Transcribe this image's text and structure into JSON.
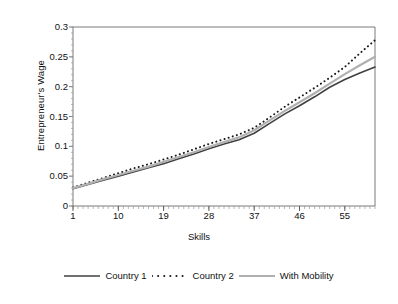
{
  "chart_data": {
    "type": "line",
    "title": "",
    "xlabel": "Skills",
    "ylabel": "Entrepreneur's Wage",
    "xlim": [
      1,
      61
    ],
    "ylim": [
      0,
      0.3
    ],
    "grid": false,
    "legend_position": "bottom",
    "xticks": [
      "1",
      "10",
      "19",
      "28",
      "37",
      "46",
      "55"
    ],
    "xtick_values": [
      1,
      10,
      19,
      28,
      37,
      46,
      55
    ],
    "yticks": [
      "0",
      "0.05",
      "0.1",
      "0.15",
      "0.2",
      "0.25",
      "0.3"
    ],
    "ytick_values": [
      0,
      0.05,
      0.1,
      0.15,
      0.2,
      0.25,
      0.3
    ],
    "x": [
      1,
      4,
      7,
      10,
      13,
      16,
      19,
      22,
      25,
      28,
      31,
      34,
      37,
      40,
      43,
      46,
      49,
      52,
      55,
      58,
      61
    ],
    "series": [
      {
        "name": "Country 1",
        "style": "solid",
        "color": "#404040",
        "width": 1.6,
        "values": [
          0.029,
          0.036,
          0.043,
          0.05,
          0.057,
          0.064,
          0.071,
          0.079,
          0.087,
          0.096,
          0.104,
          0.111,
          0.122,
          0.138,
          0.154,
          0.168,
          0.183,
          0.199,
          0.212,
          0.223,
          0.233
        ]
      },
      {
        "name": "Country 2",
        "style": "dotted",
        "color": "#1a1a1a",
        "width": 2.0,
        "values": [
          0.031,
          0.039,
          0.047,
          0.055,
          0.063,
          0.07,
          0.078,
          0.086,
          0.095,
          0.104,
          0.112,
          0.12,
          0.131,
          0.148,
          0.166,
          0.182,
          0.198,
          0.215,
          0.233,
          0.256,
          0.278
        ]
      },
      {
        "name": "With Mobility",
        "style": "solid",
        "color": "#b0b0b0",
        "width": 2.2,
        "values": [
          0.03,
          0.037,
          0.045,
          0.052,
          0.059,
          0.066,
          0.074,
          0.082,
          0.09,
          0.099,
          0.107,
          0.115,
          0.127,
          0.143,
          0.159,
          0.174,
          0.189,
          0.205,
          0.221,
          0.236,
          0.25
        ]
      }
    ]
  },
  "legend": {
    "items": [
      {
        "label": "Country 1"
      },
      {
        "label": "Country 2"
      },
      {
        "label": "With Mobility"
      }
    ]
  },
  "colors": {
    "country1": "#404040",
    "country2": "#1a1a1a",
    "with_mobility": "#b0b0b0",
    "axis": "#555555",
    "background": "#ffffff"
  }
}
